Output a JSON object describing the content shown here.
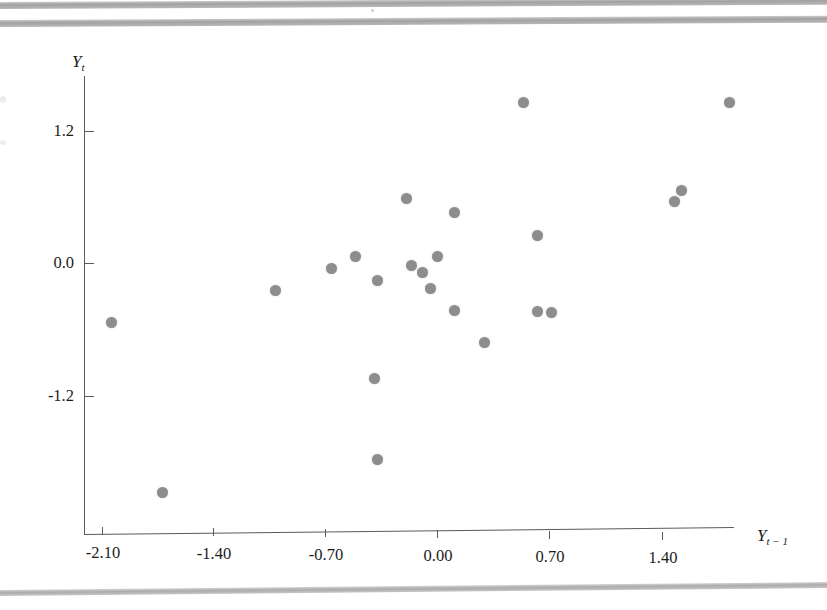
{
  "figure": {
    "background": "#ffffff",
    "point_color": "#8d8d8d",
    "axis_color": "#5b5b5b",
    "y_axis_title": "Y",
    "y_axis_sub": "t",
    "x_axis_title": "Y",
    "x_axis_sub": "t − 1"
  },
  "chart_data": {
    "type": "scatter",
    "title": "",
    "xlabel": "Y t-1",
    "ylabel": "Y t",
    "xlim": [
      -2.21,
      1.86
    ],
    "ylim": [
      -2.43,
      1.55
    ],
    "grid": false,
    "legend": null,
    "xticks": [
      "-2.10",
      "-1.40",
      "-0.70",
      "0.00",
      "0.70",
      "1.40"
    ],
    "xtick_values": [
      -2.1,
      -1.4,
      -0.7,
      0.0,
      0.7,
      1.4
    ],
    "yticks": [
      "1.2",
      "0.0",
      "-1.2"
    ],
    "ytick_values": [
      1.2,
      0.0,
      -1.2
    ],
    "n_points": 26,
    "points": [
      {
        "x": -2.04,
        "y": -0.54
      },
      {
        "x": -1.72,
        "y": -2.08
      },
      {
        "x": -1.01,
        "y": -0.25
      },
      {
        "x": -0.66,
        "y": -0.05
      },
      {
        "x": -0.51,
        "y": 0.06
      },
      {
        "x": -0.37,
        "y": -0.16
      },
      {
        "x": -0.39,
        "y": -1.05
      },
      {
        "x": -0.37,
        "y": -1.78
      },
      {
        "x": -0.19,
        "y": 0.58
      },
      {
        "x": -0.16,
        "y": -0.02
      },
      {
        "x": -0.09,
        "y": -0.09
      },
      {
        "x": -0.04,
        "y": -0.23
      },
      {
        "x": 0.0,
        "y": 0.06
      },
      {
        "x": 0.11,
        "y": 0.46
      },
      {
        "x": 0.11,
        "y": -0.43
      },
      {
        "x": 0.3,
        "y": -0.72
      },
      {
        "x": 0.54,
        "y": 1.45
      },
      {
        "x": 0.63,
        "y": 0.25
      },
      {
        "x": 0.63,
        "y": -0.44
      },
      {
        "x": 0.72,
        "y": -0.45
      },
      {
        "x": 1.49,
        "y": 0.56
      },
      {
        "x": 1.53,
        "y": 0.66
      },
      {
        "x": 1.83,
        "y": 1.45
      }
    ]
  }
}
